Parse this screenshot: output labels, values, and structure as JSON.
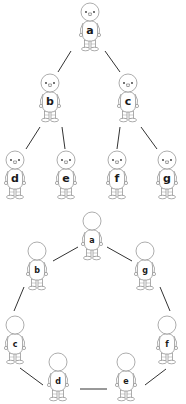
{
  "diagram": {
    "tree": {
      "nodes": [
        {
          "id": "a",
          "label": "a",
          "x": 90,
          "y": 3,
          "face": true
        },
        {
          "id": "b",
          "label": "b",
          "x": 50,
          "y": 74,
          "face": true
        },
        {
          "id": "c",
          "label": "c",
          "x": 128,
          "y": 74,
          "face": true
        },
        {
          "id": "d",
          "label": "d",
          "x": 15,
          "y": 151,
          "face": true
        },
        {
          "id": "e",
          "label": "e",
          "x": 66,
          "y": 151,
          "face": true
        },
        {
          "id": "f",
          "label": "f",
          "x": 117,
          "y": 151,
          "face": true
        },
        {
          "id": "g",
          "label": "g",
          "x": 167,
          "y": 151,
          "face": true
        }
      ],
      "edges": [
        {
          "from": "a",
          "to": "b",
          "x1": 71,
          "y1": 51,
          "x2": 58,
          "y2": 72
        },
        {
          "from": "a",
          "to": "c",
          "x1": 105,
          "y1": 51,
          "x2": 120,
          "y2": 72
        },
        {
          "from": "b",
          "to": "d",
          "x1": 40,
          "y1": 127,
          "x2": 26,
          "y2": 149
        },
        {
          "from": "b",
          "to": "e",
          "x1": 62,
          "y1": 127,
          "x2": 65,
          "y2": 149
        },
        {
          "from": "c",
          "to": "f",
          "x1": 120,
          "y1": 127,
          "x2": 117,
          "y2": 149
        },
        {
          "from": "c",
          "to": "g",
          "x1": 141,
          "y1": 127,
          "x2": 157,
          "y2": 149
        }
      ]
    },
    "ring": {
      "nodes": [
        {
          "id": "a",
          "label": "a",
          "x": 92,
          "y": 212,
          "face": false
        },
        {
          "id": "b",
          "label": "b",
          "x": 37,
          "y": 242,
          "face": false
        },
        {
          "id": "g",
          "label": "g",
          "x": 145,
          "y": 242,
          "face": false
        },
        {
          "id": "c",
          "label": "c",
          "x": 15,
          "y": 316,
          "face": false
        },
        {
          "id": "f",
          "label": "f",
          "x": 167,
          "y": 316,
          "face": false
        },
        {
          "id": "d",
          "label": "d",
          "x": 58,
          "y": 353,
          "face": false
        },
        {
          "id": "e",
          "label": "e",
          "x": 126,
          "y": 353,
          "face": false
        }
      ],
      "edges": [
        {
          "from": "a",
          "to": "b",
          "x1": 78,
          "y1": 247,
          "x2": 53,
          "y2": 261
        },
        {
          "from": "a",
          "to": "g",
          "x1": 107,
          "y1": 247,
          "x2": 132,
          "y2": 261
        },
        {
          "from": "b",
          "to": "c",
          "x1": 24,
          "y1": 287,
          "x2": 14,
          "y2": 311
        },
        {
          "from": "g",
          "to": "f",
          "x1": 160,
          "y1": 287,
          "x2": 170,
          "y2": 311
        },
        {
          "from": "c",
          "to": "d",
          "x1": 20,
          "y1": 368,
          "x2": 43,
          "y2": 385
        },
        {
          "from": "d",
          "to": "e",
          "x1": 80,
          "y1": 389,
          "x2": 107,
          "y2": 389
        },
        {
          "from": "e",
          "to": "f",
          "x1": 145,
          "y1": 385,
          "x2": 166,
          "y2": 369
        }
      ]
    }
  }
}
